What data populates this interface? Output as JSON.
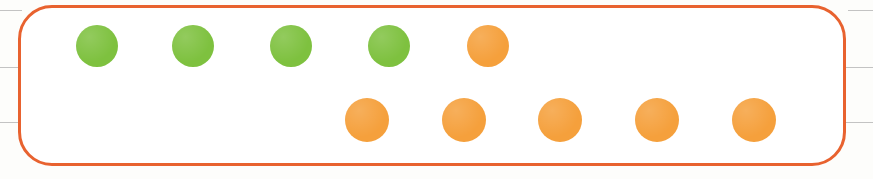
{
  "canvas": {
    "width": 873,
    "height": 179,
    "background": "#fdfdfb"
  },
  "highlight_box": {
    "label": "grouped-items-highlight",
    "border_color": "#e8622f",
    "border_width": 3,
    "corner_radius": 34,
    "fill": "#ffffff",
    "x": 18,
    "y": 5,
    "width": 828,
    "height": 161
  },
  "guide_lines": {
    "color": "#b8b8b8",
    "lines": [
      {
        "y": 10,
        "segments": [
          {
            "x": 0,
            "width": 22
          },
          {
            "x": 848,
            "width": 25
          }
        ]
      },
      {
        "y": 67,
        "segments": [
          {
            "x": 0,
            "width": 20
          },
          {
            "x": 846,
            "width": 27
          }
        ]
      },
      {
        "y": 122,
        "segments": [
          {
            "x": 0,
            "width": 20
          },
          {
            "x": 846,
            "width": 27
          }
        ]
      }
    ]
  },
  "colors": {
    "green": "#7ec13f",
    "orange": "#f5a03c",
    "highlight_border": "#e8622f",
    "guide": "#b8b8b8"
  },
  "counters": {
    "type": "two-row-dot-counter",
    "rows": [
      {
        "name": "top-row",
        "center_y": 46,
        "dot_diameter": 42,
        "dots": [
          {
            "index": 1,
            "color_name": "green",
            "color": "#7ec13f",
            "center_x": 97
          },
          {
            "index": 2,
            "color_name": "green",
            "color": "#7ec13f",
            "center_x": 193
          },
          {
            "index": 3,
            "color_name": "green",
            "color": "#7ec13f",
            "center_x": 291
          },
          {
            "index": 4,
            "color_name": "green",
            "color": "#7ec13f",
            "center_x": 389
          },
          {
            "index": 5,
            "color_name": "orange",
            "color": "#f5a03c",
            "center_x": 488
          }
        ]
      },
      {
        "name": "bottom-row",
        "center_y": 120,
        "dot_diameter": 44,
        "dots": [
          {
            "index": 1,
            "color_name": "orange",
            "color": "#f5a03c",
            "center_x": 367
          },
          {
            "index": 2,
            "color_name": "orange",
            "color": "#f5a03c",
            "center_x": 464
          },
          {
            "index": 3,
            "color_name": "orange",
            "color": "#f5a03c",
            "center_x": 560
          },
          {
            "index": 4,
            "color_name": "orange",
            "color": "#f5a03c",
            "center_x": 657
          },
          {
            "index": 5,
            "color_name": "orange",
            "color": "#f5a03c",
            "center_x": 754
          }
        ]
      }
    ],
    "totals": {
      "green_count": 4,
      "orange_count": 6,
      "total_count": 10
    }
  }
}
